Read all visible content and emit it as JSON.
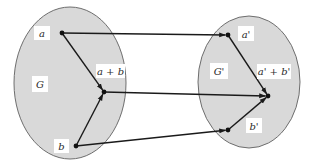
{
  "diagram": {
    "colors": {
      "set_fill": "#d9d9d9",
      "set_stroke": "#6e6e6e",
      "edge": "#1a1a1a",
      "label_bg": "#ffffff",
      "text": "#2a2a2a"
    },
    "sets": [
      {
        "id": "G",
        "label": "G"
      },
      {
        "id": "Gp",
        "label": "G'"
      }
    ],
    "elements": [
      {
        "id": "a",
        "label": "a",
        "set": "G"
      },
      {
        "id": "apb",
        "label": "a + b",
        "set": "G"
      },
      {
        "id": "b",
        "label": "b",
        "set": "G"
      },
      {
        "id": "ap",
        "label": "a'",
        "set": "Gp"
      },
      {
        "id": "apbp",
        "label": "a' + b'",
        "set": "Gp"
      },
      {
        "id": "bp",
        "label": "b'",
        "set": "Gp"
      }
    ],
    "edges": [
      {
        "from": "a",
        "to": "apb",
        "kind": "operation"
      },
      {
        "from": "b",
        "to": "apb",
        "kind": "operation"
      },
      {
        "from": "ap",
        "to": "apbp",
        "kind": "operation"
      },
      {
        "from": "bp",
        "to": "apbp",
        "kind": "operation"
      },
      {
        "from": "a",
        "to": "ap",
        "kind": "mapping"
      },
      {
        "from": "apb",
        "to": "apbp",
        "kind": "mapping"
      },
      {
        "from": "b",
        "to": "bp",
        "kind": "mapping"
      }
    ]
  }
}
